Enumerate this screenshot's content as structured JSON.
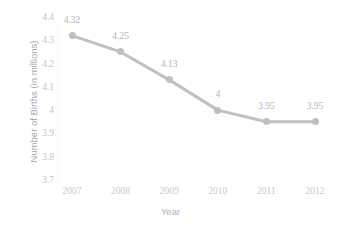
{
  "chart_data": {
    "type": "line",
    "title": "",
    "xlabel": "Year",
    "ylabel": "Number of Births (in millions)",
    "categories": [
      "2007",
      "2008",
      "2009",
      "2010",
      "2011",
      "2012"
    ],
    "values": [
      4.32,
      4.25,
      4.13,
      4,
      3.95,
      3.95
    ],
    "point_labels": [
      "4.32",
      "4.25",
      "4.13",
      "4",
      "3.95",
      "3.95"
    ],
    "ylim": [
      3.7,
      4.4
    ],
    "ytick_labels": [
      "4.4",
      "4.3",
      "4.2",
      "4.1",
      "4",
      "3.9",
      "3.8",
      "3.7"
    ],
    "ytick_values": [
      4.4,
      4.3,
      4.2,
      4.1,
      4.0,
      3.9,
      3.8,
      3.7
    ],
    "grid": false,
    "legend": "none",
    "series": [
      {
        "name": "Number of Births",
        "values": [
          4.32,
          4.25,
          4.13,
          4,
          3.95,
          3.95
        ],
        "color": "#c0c0c0",
        "marker": "circle"
      }
    ],
    "colors": {
      "line": "#c0c0c0",
      "marker": "#bfbfbf",
      "data_label": "#b5b5b5",
      "tick_label": "#c6c6c6",
      "axis_title": "#aeaeae",
      "background": "#ffffff"
    }
  }
}
